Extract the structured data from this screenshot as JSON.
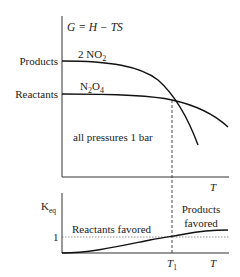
{
  "top_panel": {
    "equation": "G = H − TS",
    "y_labels": {
      "products": "Products",
      "reactants": "Reactants"
    },
    "curve_labels": {
      "products_species": "2 NO",
      "products_sub": "2",
      "reactants_species_a": "N",
      "reactants_sub_a": "2",
      "reactants_species_b": "O",
      "reactants_sub_b": "4"
    },
    "annotation": "all pressures 1 bar",
    "x_label": "T"
  },
  "bottom_panel": {
    "y_label": "K",
    "y_label_sub": "eq",
    "y_tick": "1",
    "region_left": "Reactants favored",
    "region_right_line1": "Products",
    "region_right_line2": "favored",
    "x_tick": "T",
    "x_tick_sub": "1",
    "x_label": "T"
  }
}
